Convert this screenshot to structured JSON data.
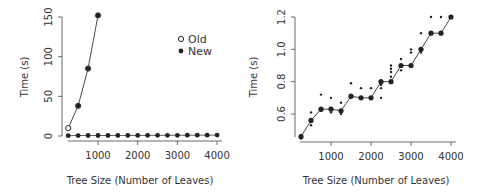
{
  "chart_data": [
    {
      "type": "line",
      "title": "",
      "xlabel": "Tree Size (Number of Leaves)",
      "ylabel": "Time (s)",
      "x_ticks": [
        1000,
        2000,
        3000,
        4000
      ],
      "y_ticks": [
        0,
        50,
        100,
        150
      ],
      "xlim": [
        250,
        4000
      ],
      "ylim": [
        0,
        150
      ],
      "grid": false,
      "legend_position": "upper right",
      "legend": [
        {
          "label": "Old",
          "marker": "open-circle"
        },
        {
          "label": "New",
          "marker": "filled-circle"
        }
      ],
      "series": [
        {
          "name": "Old",
          "marker": "open-circle",
          "x": [
            250,
            500,
            750,
            1000
          ],
          "values": [
            10,
            38,
            85,
            152
          ]
        },
        {
          "name": "New",
          "marker": "filled-circle",
          "x": [
            250,
            500,
            750,
            1000,
            1250,
            1500,
            1750,
            2000,
            2250,
            2500,
            2750,
            3000,
            3250,
            3500,
            3750,
            4000
          ],
          "values": [
            0.46,
            0.56,
            0.63,
            0.63,
            0.62,
            0.71,
            0.7,
            0.7,
            0.8,
            0.8,
            0.9,
            0.9,
            1.0,
            1.1,
            1.1,
            1.2
          ]
        }
      ]
    },
    {
      "type": "line",
      "title": "",
      "xlabel": "Tree Size (Number of Leaves)",
      "ylabel": "Time (s)",
      "x_ticks": [
        1000,
        2000,
        3000,
        4000
      ],
      "y_ticks": [
        0.6,
        0.8,
        1.0,
        1.2
      ],
      "xlim": [
        250,
        4000
      ],
      "ylim": [
        0.45,
        1.2
      ],
      "grid": false,
      "series": [
        {
          "name": "New (median)",
          "marker": "filled-circle",
          "x": [
            250,
            500,
            750,
            1000,
            1250,
            1500,
            1750,
            2000,
            2250,
            2500,
            2750,
            3000,
            3250,
            3500,
            3750,
            4000
          ],
          "values": [
            0.46,
            0.56,
            0.63,
            0.63,
            0.62,
            0.71,
            0.7,
            0.7,
            0.8,
            0.8,
            0.9,
            0.9,
            1.0,
            1.1,
            1.1,
            1.2
          ]
        },
        {
          "name": "New (individual runs)",
          "marker": "small-dot",
          "points": [
            [
              250,
              0.45
            ],
            [
              250,
              0.47
            ],
            [
              500,
              0.61
            ],
            [
              500,
              0.53
            ],
            [
              500,
              0.55
            ],
            [
              750,
              0.72
            ],
            [
              750,
              0.62
            ],
            [
              1000,
              0.7
            ],
            [
              1000,
              0.61
            ],
            [
              1250,
              0.67
            ],
            [
              1250,
              0.6
            ],
            [
              1500,
              0.79
            ],
            [
              1500,
              0.7
            ],
            [
              1750,
              0.76
            ],
            [
              2000,
              0.76
            ],
            [
              2250,
              0.76
            ],
            [
              2250,
              0.7
            ],
            [
              2250,
              0.78
            ],
            [
              2500,
              0.9
            ],
            [
              2500,
              0.88
            ],
            [
              2500,
              0.86
            ],
            [
              2500,
              0.83
            ],
            [
              2750,
              0.94
            ],
            [
              2750,
              0.87
            ],
            [
              3000,
              1.0
            ],
            [
              3000,
              0.98
            ],
            [
              3250,
              1.1
            ],
            [
              3250,
              0.98
            ],
            [
              3500,
              1.2
            ],
            [
              3750,
              1.2
            ]
          ]
        }
      ]
    }
  ],
  "left_chart": {
    "xlabel": "Tree Size (Number of Leaves)",
    "ylabel": "Time (s)",
    "x_tick_labels": [
      "1000",
      "2000",
      "3000",
      "4000"
    ],
    "y_tick_labels": [
      "0",
      "50",
      "100",
      "150"
    ],
    "legend_old": "Old",
    "legend_new": "New"
  },
  "right_chart": {
    "xlabel": "Tree Size (Number of Leaves)",
    "ylabel": "Time (s)",
    "x_tick_labels": [
      "1000",
      "2000",
      "3000",
      "4000"
    ],
    "y_tick_labels": [
      "0.6",
      "0.8",
      "1.0",
      "1.2"
    ]
  }
}
